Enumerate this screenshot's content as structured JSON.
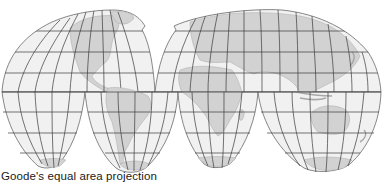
{
  "figure": {
    "caption": "Goode's equal area projection",
    "projection": "Goode homolosine (interrupted)",
    "colors": {
      "ocean": "#f1f1f1",
      "land": "#d2d2d2",
      "land_stroke": "#a8a8a8",
      "graticule": "#3a3a3a",
      "outline": "#555555",
      "background": "#ffffff"
    },
    "lobes": [
      {
        "name": "north-america",
        "hemisphere": "north"
      },
      {
        "name": "eurasia",
        "hemisphere": "north"
      },
      {
        "name": "north-pacific",
        "hemisphere": "south"
      },
      {
        "name": "south-america",
        "hemisphere": "south"
      },
      {
        "name": "africa",
        "hemisphere": "south"
      },
      {
        "name": "oceania",
        "hemisphere": "south"
      }
    ],
    "continents": [
      "North America",
      "South America",
      "Europe",
      "Asia",
      "Africa",
      "Australia",
      "Antarctica",
      "Greenland"
    ]
  }
}
